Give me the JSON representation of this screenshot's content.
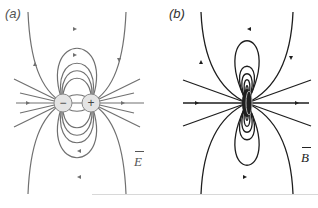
{
  "panels": [
    {
      "id": "a",
      "label": "(a)",
      "field_label": "E",
      "title": "Electric dipole field",
      "charges": [
        {
          "sign": "−",
          "x": 63,
          "y": 103
        },
        {
          "sign": "+",
          "x": 91,
          "y": 103
        }
      ],
      "line_color": "#6e6e6e"
    },
    {
      "id": "b",
      "label": "(b)",
      "field_label": "B",
      "title": "Magnetic dipole field (current loop)",
      "line_color": "#1e1e1e"
    }
  ]
}
